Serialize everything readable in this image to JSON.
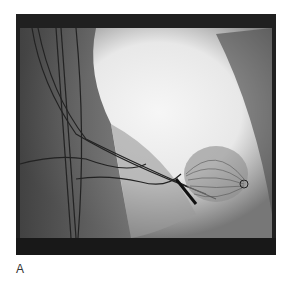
{
  "figure": {
    "panel_label": "A",
    "image_description": "Fluoroscopic angiography image showing catheters and a spherical mesh device",
    "colors": {
      "frame": "#1a1a1a",
      "bright": "#f4f4f4",
      "mid": "#8a8a8a",
      "dark": "#3a3a3a"
    }
  }
}
